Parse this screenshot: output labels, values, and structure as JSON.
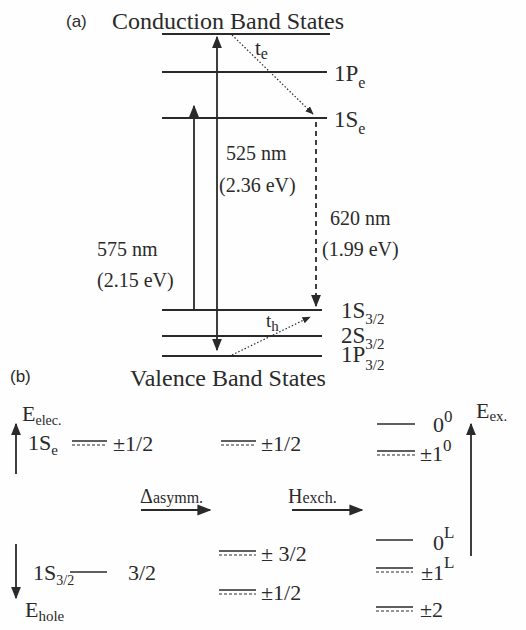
{
  "panel_a": {
    "label": "(a)",
    "title_top": "Conduction Band States",
    "title_bottom": "Valence Band States",
    "conduction_levels": [
      {
        "name": "top",
        "label": ""
      },
      {
        "name": "1Pe",
        "main": "1P",
        "sub": "e"
      },
      {
        "name": "1Se",
        "main": "1S",
        "sub": "e"
      }
    ],
    "valence_levels": [
      {
        "name": "1S3/2",
        "main": "1S",
        "sub": "3/2"
      },
      {
        "name": "2S3/2",
        "main": "2S",
        "sub": "3/2"
      },
      {
        "name": "1P3/2",
        "main": "1P",
        "sub": "3/2"
      }
    ],
    "transitions": {
      "absorption_high": {
        "wavelength": "525 nm",
        "energy": "(2.36 eV)"
      },
      "emission": {
        "wavelength": "620 nm",
        "energy": "(1.99 eV)"
      },
      "absorption_low": {
        "wavelength": "575 nm",
        "energy": "(2.15 eV)"
      }
    },
    "relaxation": {
      "electron": {
        "main": "t",
        "sub": "e"
      },
      "hole": {
        "main": "t",
        "sub": "h"
      }
    }
  },
  "panel_b": {
    "label": "(b)",
    "axis_electron": {
      "main": "E",
      "sub": "elec."
    },
    "axis_hole": {
      "main": "E",
      "sub": "hole"
    },
    "axis_exciton": {
      "main": "E",
      "sub": "ex."
    },
    "electron_state": {
      "main": "1S",
      "sub": "e",
      "value": "±1/2"
    },
    "hole_state": {
      "main": "1S",
      "sub": "3/2",
      "value": "3/2"
    },
    "step1": {
      "main": "Δ",
      "sub": "asymm."
    },
    "step2": {
      "main": "H",
      "sub": "exch."
    },
    "asym_levels": [
      "±1/2",
      "± 3/2",
      "±1/2"
    ],
    "exciton_levels": [
      {
        "main": "0",
        "sup": "0"
      },
      {
        "main": "±1",
        "sup": "0"
      },
      {
        "main": "0",
        "sup": "L"
      },
      {
        "main": "±1",
        "sup": "L"
      },
      {
        "main": "±2",
        "sup": ""
      }
    ]
  }
}
